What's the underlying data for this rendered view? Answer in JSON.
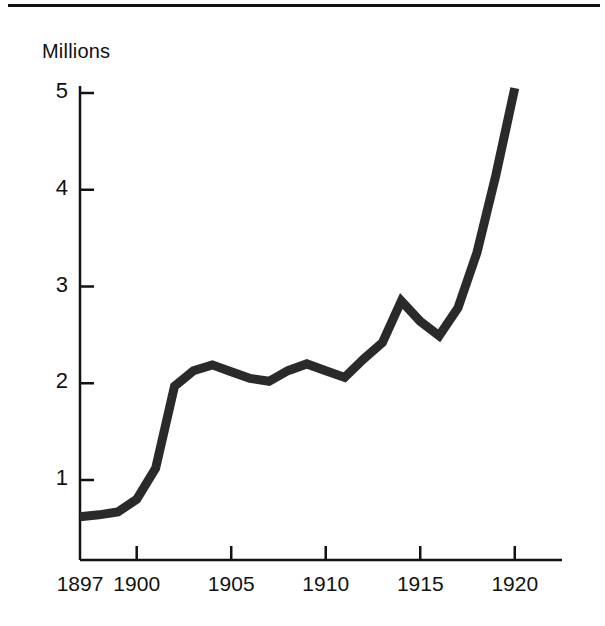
{
  "figure": {
    "top_rule": true,
    "background_color": "#ffffff",
    "ink_color": "#111111"
  },
  "axis": {
    "y_title": "Millions",
    "y_ticks": [
      1,
      2,
      3,
      4,
      5
    ],
    "y_tick_labels": [
      "1",
      "2",
      "3",
      "4",
      "5"
    ],
    "x_ticks": [
      1897,
      1900,
      1905,
      1910,
      1915,
      1920
    ],
    "x_tick_labels": [
      "1897",
      "1900",
      "1905",
      "1910",
      "1915",
      "1920"
    ]
  },
  "chart_data": {
    "type": "line",
    "title": "",
    "subtitle": "",
    "xlabel": "",
    "ylabel": "Millions",
    "xlim": [
      1897,
      1922.5
    ],
    "ylim": [
      0,
      5.4
    ],
    "grid": false,
    "legend": null,
    "series": [
      {
        "name": "Millions",
        "color": "#2a2a2a",
        "line_width": 9,
        "x": [
          1897,
          1898,
          1899,
          1900,
          1901,
          1902,
          1903,
          1904,
          1905,
          1906,
          1907,
          1908,
          1909,
          1910,
          1911,
          1912,
          1913,
          1914,
          1915,
          1916,
          1917,
          1918,
          1919,
          1920
        ],
        "values": [
          0.62,
          0.64,
          0.67,
          0.8,
          1.12,
          1.97,
          2.13,
          2.19,
          2.12,
          2.05,
          2.02,
          2.13,
          2.2,
          2.13,
          2.06,
          2.25,
          2.42,
          2.85,
          2.64,
          2.49,
          2.78,
          3.35,
          4.15,
          5.05
        ]
      }
    ],
    "annotations": []
  }
}
